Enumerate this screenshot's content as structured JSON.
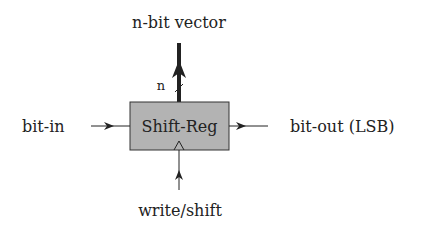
{
  "diagram": {
    "top_label": "n-bit vector",
    "bus_width_label": "n",
    "block_label": "Shift-Reg",
    "input_label": "bit-in",
    "output_label": "bit-out (LSB)",
    "control_label": "write/shift",
    "colors": {
      "block_fill": "#b3b3b3",
      "stroke": "#222222",
      "background": "#ffffff"
    }
  }
}
